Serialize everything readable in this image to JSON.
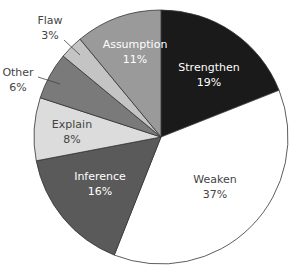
{
  "chart_data": {
    "type": "pie",
    "title": "",
    "categories": [
      "Strengthen",
      "Weaken",
      "Inference",
      "Explain",
      "Other",
      "Flaw",
      "Assumption"
    ],
    "values": [
      19,
      37,
      16,
      8,
      6,
      3,
      11
    ],
    "unit": "%",
    "colors": [
      "#1a1a1a",
      "#ffffff",
      "#5a5a5a",
      "#dcdcdc",
      "#7a7a7a",
      "#c4c4c4",
      "#9a9a9a"
    ],
    "label_colors": [
      "#ffffff",
      "#444444",
      "#ffffff",
      "#444444",
      "#444444",
      "#444444",
      "#ffffff"
    ],
    "labels": [
      {
        "name": "Strengthen",
        "pct": "19%"
      },
      {
        "name": "Weaken",
        "pct": "37%"
      },
      {
        "name": "Inference",
        "pct": "16%"
      },
      {
        "name": "Explain",
        "pct": "8%"
      },
      {
        "name": "Other",
        "pct": "6%"
      },
      {
        "name": "Flaw",
        "pct": "3%"
      },
      {
        "name": "Assumption",
        "pct": "11%"
      }
    ],
    "legend": "none",
    "start_angle_deg": 0
  }
}
